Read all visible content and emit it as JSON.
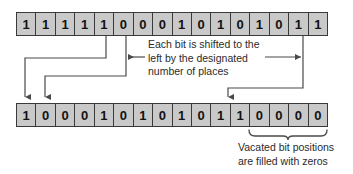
{
  "diagram": {
    "source_row": {
      "name": "original bit pattern",
      "bits": [
        "1",
        "1",
        "1",
        "1",
        "1",
        "0",
        "0",
        "0",
        "1",
        "0",
        "1",
        "0",
        "1",
        "0",
        "1",
        "1"
      ]
    },
    "result_row": {
      "name": "shifted bit pattern",
      "bits": [
        "1",
        "0",
        "0",
        "0",
        "1",
        "0",
        "1",
        "0",
        "1",
        "0",
        "1",
        "1",
        "0",
        "0",
        "0",
        "0"
      ]
    },
    "annotations": {
      "shift_note": "Each bit is shifted to the\nleft by the designated\nnumber of places",
      "vacated_note": "Vacated bit positions\nare filled with zeros"
    },
    "colors": {
      "cell_fill": "#c9c9c9",
      "cell_border": "#3a3a3a",
      "line": "#4a4a4a",
      "text": "#2b2b2b",
      "background": "#ffffff"
    }
  }
}
